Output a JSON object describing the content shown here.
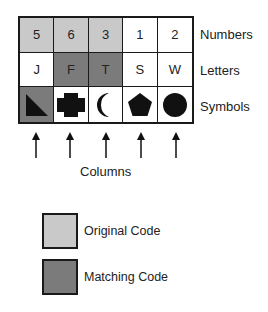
{
  "colors": {
    "original_code": "#c9c9c9",
    "matching_code": "#7b7b7b",
    "border": "#1a1a1a",
    "symbol_fill": "#111111"
  },
  "rows": [
    {
      "label": "Numbers",
      "cells": [
        {
          "value": "5",
          "highlight": "original"
        },
        {
          "value": "6",
          "highlight": "original"
        },
        {
          "value": "3",
          "highlight": "original"
        },
        {
          "value": "1",
          "highlight": "none"
        },
        {
          "value": "2",
          "highlight": "none"
        }
      ]
    },
    {
      "label": "Letters",
      "cells": [
        {
          "value": "J",
          "highlight": "none"
        },
        {
          "value": "F",
          "highlight": "matching"
        },
        {
          "value": "T",
          "highlight": "matching"
        },
        {
          "value": "S",
          "highlight": "none"
        },
        {
          "value": "W",
          "highlight": "none"
        }
      ]
    },
    {
      "label": "Symbols",
      "cells": [
        {
          "value": "triangle",
          "highlight": "matching"
        },
        {
          "value": "cross",
          "highlight": "none"
        },
        {
          "value": "crescent",
          "highlight": "none"
        },
        {
          "value": "pentagon",
          "highlight": "none"
        },
        {
          "value": "circle",
          "highlight": "none"
        }
      ]
    }
  ],
  "columns_label": "Columns",
  "legend": [
    {
      "label": "Original Code",
      "color": "#c9c9c9"
    },
    {
      "label": "Matching Code",
      "color": "#7b7b7b"
    }
  ]
}
